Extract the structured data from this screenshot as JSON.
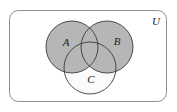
{
  "figure": {
    "type": "venn-diagram",
    "universe": {
      "label": "U",
      "label_x": 156,
      "label_y": 22,
      "box": {
        "x": 9.5,
        "y": 10.5,
        "width": 157,
        "height": 91,
        "radius": 9
      }
    },
    "sets": [
      {
        "id": "A",
        "label": "A",
        "label_x": 66,
        "label_y": 43,
        "cx": 72,
        "cy": 47,
        "r": 26,
        "shaded": true
      },
      {
        "id": "B",
        "label": "B",
        "label_x": 117,
        "label_y": 42,
        "cx": 107,
        "cy": 47,
        "r": 26,
        "shaded": true
      },
      {
        "id": "C",
        "label": "C",
        "label_x": 91,
        "label_y": 80,
        "cx": 90,
        "cy": 68,
        "r": 26,
        "shaded": false
      }
    ],
    "colors": {
      "shaded_fill": "#b6b6b6",
      "unshaded_fill": "#fbfbfb",
      "circle_stroke": "#3a3a3a",
      "box_stroke": "#8f8f8f",
      "background": "#ffffff",
      "label_color": "#1a1a1a"
    },
    "strokes": {
      "circle_width": 0.9,
      "box_width": 1.0
    }
  }
}
